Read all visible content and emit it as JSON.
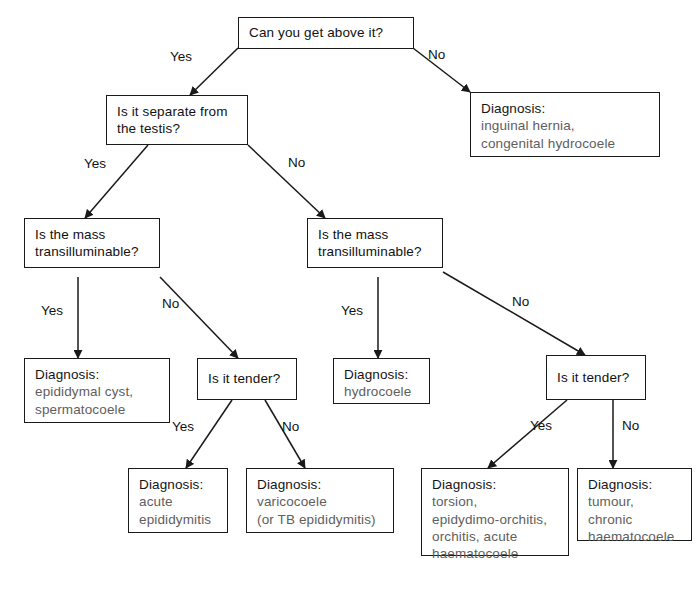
{
  "diagram": {
    "type": "decision-tree",
    "line_color": "#1a1a1a",
    "text_color": "#111111",
    "muted_text_color": "#5e5e5e",
    "background": "#ffffff"
  },
  "nodes": {
    "q_above": {
      "kind": "question",
      "lines": [
        "Can you get above it?"
      ]
    },
    "dx_hernia": {
      "kind": "diagnosis",
      "head": "Diagnosis:",
      "lines": [
        "inguinal hernia,",
        "congenital hydrocoele"
      ]
    },
    "q_separate": {
      "kind": "question",
      "lines": [
        "Is it separate from",
        "the testis?"
      ]
    },
    "q_translum_left": {
      "kind": "question",
      "lines": [
        "Is the mass",
        "transilluminable?"
      ]
    },
    "q_translum_right": {
      "kind": "question",
      "lines": [
        "Is the mass",
        "transilluminable?"
      ]
    },
    "dx_cyst": {
      "kind": "diagnosis",
      "head": "Diagnosis:",
      "lines": [
        "epididymal cyst,",
        "spermatocoele"
      ]
    },
    "q_tender_left": {
      "kind": "question",
      "lines": [
        "Is it tender?"
      ]
    },
    "dx_hydrocoele": {
      "kind": "diagnosis",
      "head": "Diagnosis:",
      "lines": [
        "hydrocoele"
      ]
    },
    "q_tender_right": {
      "kind": "question",
      "lines": [
        "Is it tender?"
      ]
    },
    "dx_acute_epi": {
      "kind": "diagnosis",
      "head": "Diagnosis:",
      "lines": [
        "acute",
        "epididymitis"
      ]
    },
    "dx_varicocoele": {
      "kind": "diagnosis",
      "head": "Diagnosis:",
      "lines": [
        "varicocoele",
        "(or TB epididymitis)"
      ]
    },
    "dx_torsion": {
      "kind": "diagnosis",
      "head": "Diagnosis:",
      "lines": [
        "torsion,",
        "epidydimo-orchitis,",
        "orchitis, acute",
        "haematocoele"
      ]
    },
    "dx_tumour": {
      "kind": "diagnosis",
      "head": "Diagnosis:",
      "lines": [
        "tumour,",
        "chronic",
        "haematocoele"
      ]
    }
  },
  "edges": [
    {
      "from": "q_above",
      "to": "q_separate",
      "label": "Yes"
    },
    {
      "from": "q_above",
      "to": "dx_hernia",
      "label": "No"
    },
    {
      "from": "q_separate",
      "to": "q_translum_left",
      "label": "Yes"
    },
    {
      "from": "q_separate",
      "to": "q_translum_right",
      "label": "No"
    },
    {
      "from": "q_translum_left",
      "to": "dx_cyst",
      "label": "Yes"
    },
    {
      "from": "q_translum_left",
      "to": "q_tender_left",
      "label": "No"
    },
    {
      "from": "q_translum_right",
      "to": "dx_hydrocoele",
      "label": "Yes"
    },
    {
      "from": "q_translum_right",
      "to": "q_tender_right",
      "label": "No"
    },
    {
      "from": "q_tender_left",
      "to": "dx_acute_epi",
      "label": "Yes"
    },
    {
      "from": "q_tender_left",
      "to": "dx_varicocoele",
      "label": "No"
    },
    {
      "from": "q_tender_right",
      "to": "dx_torsion",
      "label": "Yes"
    },
    {
      "from": "q_tender_right",
      "to": "dx_tumour",
      "label": "No"
    }
  ],
  "edge_labels": {
    "above_yes": "Yes",
    "above_no": "No",
    "separate_yes": "Yes",
    "separate_no": "No",
    "translum_left_yes": "Yes",
    "translum_left_no": "No",
    "translum_right_yes": "Yes",
    "translum_right_no": "No",
    "tender_left_yes": "Yes",
    "tender_left_no": "No",
    "tender_right_yes": "Yes",
    "tender_right_no": "No"
  }
}
